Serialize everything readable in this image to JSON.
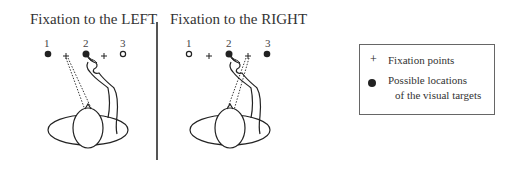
{
  "panels": [
    {
      "title": "Fixation to the LEFT",
      "location_labels": [
        "1",
        "2",
        "3"
      ],
      "targets": [
        {
          "label": "1",
          "state": "filled"
        },
        {
          "label": "2",
          "state": "filled",
          "pointed": true
        },
        {
          "label": "3",
          "state": "open"
        }
      ],
      "fixation": "left"
    },
    {
      "title": "Fixation to the RIGHT",
      "location_labels": [
        "1",
        "2",
        "3"
      ],
      "targets": [
        {
          "label": "1",
          "state": "open"
        },
        {
          "label": "2",
          "state": "filled",
          "pointed": true
        },
        {
          "label": "3",
          "state": "filled"
        }
      ],
      "fixation": "right"
    }
  ],
  "legend": {
    "fixation_symbol": "+",
    "fixation_label": "Fixation points",
    "target_label_line1": "Possible locations",
    "target_label_line2": "of the visual targets"
  },
  "colors": {
    "ink": "#222222",
    "background": "#ffffff"
  }
}
